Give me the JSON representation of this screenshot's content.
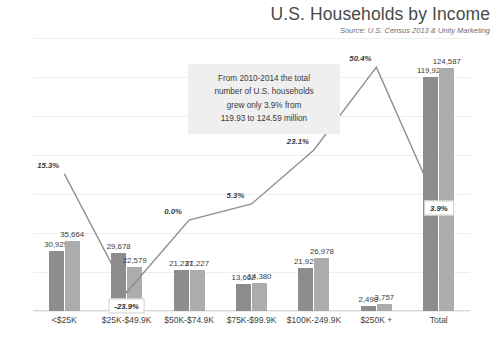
{
  "header": {
    "title": "U.S. Households by Income",
    "source": "Source: U.S. Census 2013 & Unity Marketing"
  },
  "annotation": {
    "line1": "From 2010-2014 the total",
    "line2": "number of U.S. households",
    "line3": "grew only 3.9% from",
    "line4": "119.93 to 124.59 million"
  },
  "colors": {
    "series1": "#8d8d8d",
    "series2": "#acacac",
    "line": "#8f8f8f",
    "grid": "#eeeeee",
    "annotation_bg": "#efefef"
  },
  "chart_data": {
    "type": "bar",
    "title": "U.S. Households by Income",
    "subtitle": "Source: U.S. Census 2013 & Unity Marketing",
    "xlabel": "",
    "ylabel": "",
    "grid": true,
    "legend": "none",
    "categories": [
      "<$25K",
      "$25K-$49.9K",
      "$50K-$74.9K",
      "$75K-$99.9K",
      "$100K-249.9K",
      "$250K +",
      "Total"
    ],
    "ylim": [
      0,
      140000
    ],
    "yticks": [
      "0",
      "20K",
      "40K",
      "60K",
      "80K",
      "100K",
      "120K",
      "140K"
    ],
    "ytick_values": [
      0,
      20000,
      40000,
      60000,
      80000,
      100000,
      120000,
      140000
    ],
    "y2lim": [
      -30,
      60
    ],
    "y2ticks": [
      "-30.0%",
      "-20.0%",
      "-10.0%",
      "0.0%",
      "10.0%",
      "20.0%",
      "30.0%",
      "40.0%",
      "50.0%",
      "60.0%"
    ],
    "y2tick_values": [
      -30,
      -20,
      -10,
      0,
      10,
      20,
      30,
      40,
      50,
      60
    ],
    "series": [
      {
        "name": "2010",
        "type": "bar",
        "values": [
          30929,
          29678,
          21237,
          13662,
          21923,
          2498,
          119927
        ],
        "labels": [
          "30,929",
          "29,678",
          "21,237",
          "13,662",
          "21,923",
          "2,498",
          "119,927"
        ]
      },
      {
        "name": "2014",
        "type": "bar",
        "values": [
          35664,
          22579,
          21227,
          14380,
          26978,
          3757,
          124587
        ],
        "labels": [
          "35,664",
          "22,579",
          "21,227",
          "14,380",
          "26,978",
          "3,757",
          "124,587"
        ]
      },
      {
        "name": "% Change",
        "type": "line",
        "axis": "secondary",
        "values": [
          15.3,
          -23.9,
          0.0,
          5.3,
          23.1,
          50.4,
          3.9
        ],
        "labels": [
          "15.3%",
          "-23.9%",
          "0.0%",
          "5.3%",
          "23.1%",
          "50.4%",
          "3.9%"
        ],
        "boxed_labels": [
          "-23.9%",
          "3.9%"
        ]
      }
    ]
  }
}
